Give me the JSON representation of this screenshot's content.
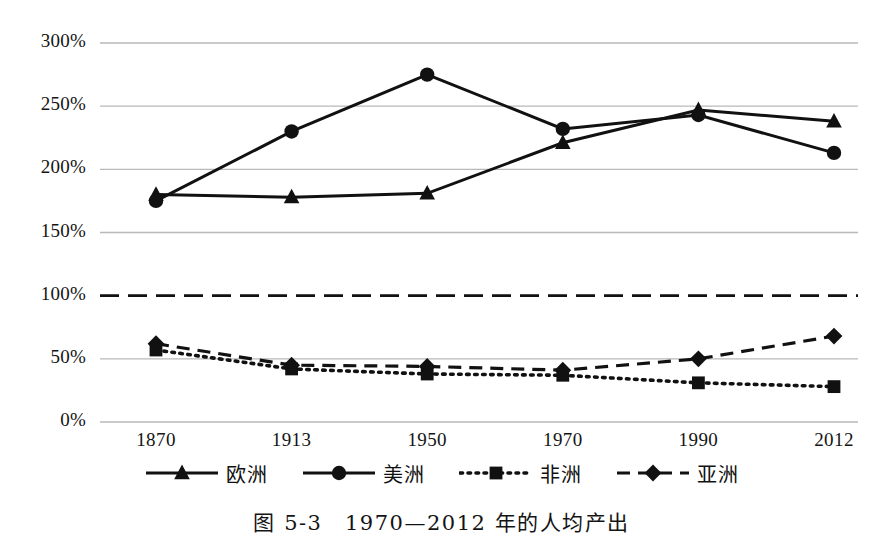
{
  "caption": "图 5-3　1970—2012 年的人均产出",
  "chart_data": {
    "type": "line",
    "title": "图 5-3　1970—2012 年的人均产出",
    "xlabel": "",
    "ylabel": "",
    "categories": [
      "1870",
      "1913",
      "1950",
      "1970",
      "1990",
      "2012"
    ],
    "x_tick_labels": [
      "1870",
      "1913",
      "1950",
      "1970",
      "1990",
      "2012"
    ],
    "y_tick_labels": [
      "0%",
      "50%",
      "100%",
      "150%",
      "200%",
      "250%",
      "300%"
    ],
    "y_tick_values": [
      0,
      50,
      100,
      150,
      200,
      250,
      300
    ],
    "ylim": [
      0,
      300
    ],
    "grid": true,
    "grid_axis": "y",
    "legend_position": "bottom",
    "reference_line": {
      "value": 100,
      "label": "100%",
      "style": "dashed"
    },
    "series": [
      {
        "name": "欧洲",
        "marker": "triangle",
        "line_style": "solid",
        "color": "#111111",
        "values": [
          180,
          178,
          181,
          221,
          247,
          238
        ]
      },
      {
        "name": "美洲",
        "marker": "circle",
        "line_style": "solid",
        "color": "#111111",
        "values": [
          175,
          230,
          275,
          232,
          243,
          213
        ]
      },
      {
        "name": "非洲",
        "marker": "square",
        "line_style": "dotted",
        "color": "#111111",
        "values": [
          57,
          42,
          38,
          37,
          31,
          28
        ]
      },
      {
        "name": "亚洲",
        "marker": "diamond",
        "line_style": "dashed",
        "color": "#111111",
        "values": [
          62,
          45,
          44,
          41,
          50,
          68
        ]
      }
    ]
  },
  "legend": {
    "items": [
      {
        "label": "欧洲",
        "marker": "triangle-marker",
        "line_style": "solid"
      },
      {
        "label": "美洲",
        "marker": "circle-marker",
        "line_style": "solid"
      },
      {
        "label": "非洲",
        "marker": "square-marker",
        "line_style": "dotted"
      },
      {
        "label": "亚洲",
        "marker": "diamond-marker",
        "line_style": "dashed"
      }
    ]
  },
  "colors": {
    "ink": "#111111",
    "gridline": "#b9b9b9",
    "background": "#ffffff"
  }
}
